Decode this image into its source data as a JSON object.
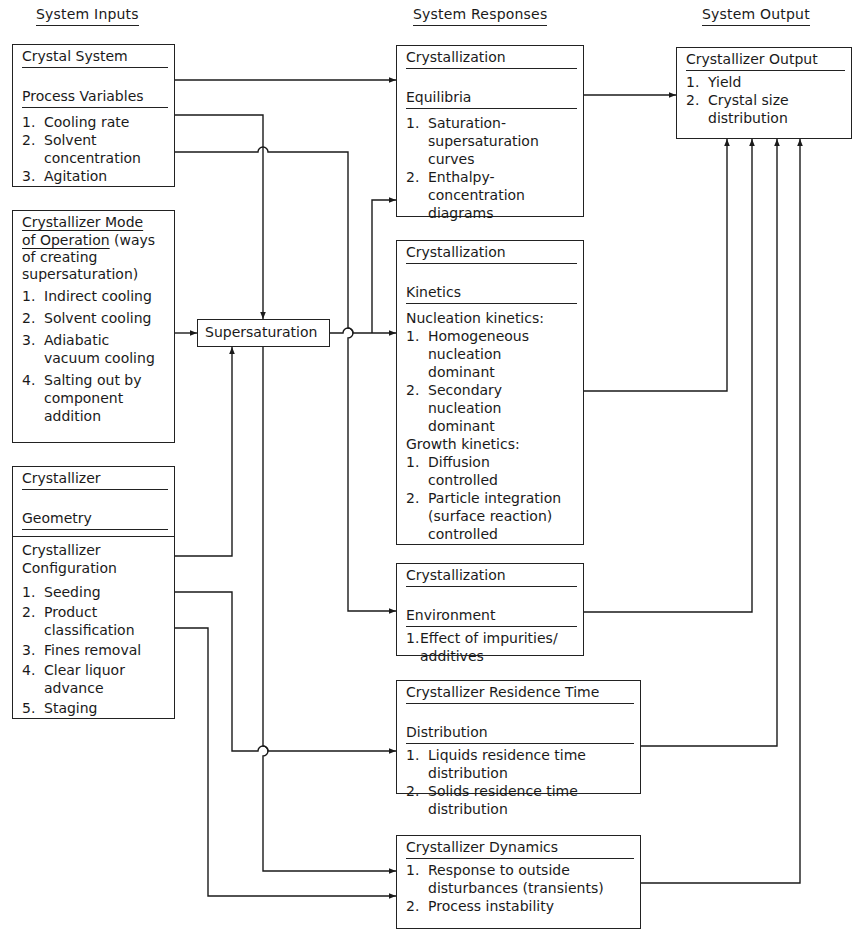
{
  "figure": {
    "cropped_title": "",
    "columns": {
      "inputs": "System Inputs",
      "responses": "System Responses",
      "output": "System Output"
    }
  },
  "inputs": {
    "crystal_system": {
      "title": "Crystal System",
      "subtitle": "Process Variables",
      "items": [
        "1.",
        "Cooling rate",
        "2.",
        "Solvent concentration",
        "3.",
        "Agitation"
      ],
      "list": [
        {
          "num": "1.",
          "text": [
            "Cooling rate"
          ]
        },
        {
          "num": "2.",
          "text": [
            "Solvent",
            "concentration"
          ]
        },
        {
          "num": "3.",
          "text": [
            "Agitation"
          ]
        }
      ]
    },
    "mode_of_operation": {
      "title_line1": "Crystallizer Mode",
      "title_line2": "of Operation",
      "title_suffix": " (ways",
      "desc_line1": "of creating",
      "desc_line2": "supersaturation)",
      "list": [
        {
          "num": "1.",
          "text": [
            "Indirect cooling"
          ]
        },
        {
          "num": "2.",
          "text": [
            "Solvent cooling"
          ]
        },
        {
          "num": "3.",
          "text": [
            "Adiabatic",
            "vacuum cooling"
          ]
        },
        {
          "num": "4.",
          "text": [
            "Salting out by",
            "component",
            "addition"
          ]
        }
      ]
    },
    "geometry": {
      "title_line1": "Crystallizer",
      "title_line2": "Geometry",
      "config_line1": "Crystallizer",
      "config_line2": "Configuration",
      "list": [
        {
          "num": "1.",
          "text": [
            "Seeding"
          ]
        },
        {
          "num": "2.",
          "text": [
            "Product",
            "classification"
          ]
        },
        {
          "num": "3.",
          "text": [
            "Fines removal"
          ]
        },
        {
          "num": "4.",
          "text": [
            "Clear liquor",
            "advance"
          ]
        },
        {
          "num": "5.",
          "text": [
            "Staging"
          ]
        }
      ]
    }
  },
  "supersaturation": {
    "label": "Supersaturation"
  },
  "responses": {
    "equilibria": {
      "title_line1": "Crystallization",
      "title_line2": "Equilibria",
      "list": [
        {
          "num": "1.",
          "text": [
            "Saturation-",
            "supersaturation",
            "curves"
          ]
        },
        {
          "num": "2.",
          "text": [
            "Enthalpy-",
            "concentration",
            "diagrams"
          ]
        }
      ]
    },
    "kinetics": {
      "title_line1": "Crystallization",
      "title_line2": "Kinetics",
      "nucleation_heading": "Nucleation kinetics:",
      "nucleation_list": [
        {
          "num": "1.",
          "text": [
            "Homogeneous",
            "nucleation",
            "dominant"
          ]
        },
        {
          "num": "2.",
          "text": [
            "Secondary",
            "nucleation",
            "dominant"
          ]
        }
      ],
      "growth_heading": "Growth kinetics:",
      "growth_list": [
        {
          "num": "1.",
          "text": [
            "Diffusion",
            "controlled"
          ]
        },
        {
          "num": "2.",
          "text": [
            "Particle integration",
            "(surface reaction)",
            "controlled"
          ]
        }
      ]
    },
    "environment": {
      "title_line1": "Crystallization",
      "title_line2": "Environment",
      "list": [
        {
          "num": "1.",
          "text": [
            "Effect of impurities/",
            "additives"
          ]
        }
      ]
    },
    "residence_time": {
      "title_line1": "Crystallizer Residence Time",
      "title_line2": "Distribution",
      "list": [
        {
          "num": "1.",
          "text": [
            "Liquids residence time",
            "distribution"
          ]
        },
        {
          "num": "2.",
          "text": [
            "Solids residence time",
            "distribution"
          ]
        }
      ]
    },
    "dynamics": {
      "title": "Crystallizer Dynamics",
      "list": [
        {
          "num": "1.",
          "text": [
            "Response to outside",
            "disturbances (transients)"
          ]
        },
        {
          "num": "2.",
          "text": [
            "Process instability"
          ]
        }
      ]
    }
  },
  "output": {
    "crystallizer_output": {
      "title": "Crystallizer Output",
      "list": [
        {
          "num": "1.",
          "text": [
            "Yield"
          ]
        },
        {
          "num": "2.",
          "text": [
            "Crystal size",
            "distribution"
          ]
        }
      ]
    }
  },
  "style": {
    "ink": "#1a1a1a",
    "paper": "#ffffff"
  }
}
